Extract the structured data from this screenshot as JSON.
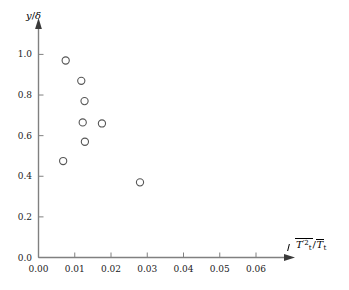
{
  "chart_data": {
    "type": "scatter",
    "title": "",
    "xlabel": "sqrt(T_t'^2)/T_t_bar",
    "ylabel": "y/delta",
    "xlim": [
      0.0,
      0.068
    ],
    "ylim": [
      0.0,
      1.13
    ],
    "xticks": [
      0.0,
      0.01,
      0.02,
      0.03,
      0.04,
      0.05,
      0.06
    ],
    "xtick_labels": [
      "0.00",
      "0.01",
      "0.02",
      "0.03",
      "0.04",
      "0.05",
      "0.06"
    ],
    "yticks": [
      0.0,
      0.2,
      0.4,
      0.6,
      0.8,
      1.0
    ],
    "ytick_labels": [
      "0.0",
      "0.2",
      "0.4",
      "0.6",
      "0.8",
      "1.0"
    ],
    "grid": false,
    "legend": "none",
    "marker": "open-circle",
    "marker_color": "#555555",
    "axis_color": "#808080",
    "series": [
      {
        "name": "total temperature fluctuation profile",
        "x": [
          0.0075,
          0.0118,
          0.0127,
          0.0122,
          0.0175,
          0.0128,
          0.0068,
          0.028
        ],
        "y": [
          0.97,
          0.87,
          0.77,
          0.665,
          0.66,
          0.57,
          0.475,
          0.37
        ]
      }
    ]
  },
  "labels": {
    "y_axis": {
      "var": "y",
      "slash": "/",
      "delta": "δ"
    },
    "x_axis": {
      "numerator_var": "T",
      "numerator_sub": "t",
      "numerator_prime_sup": "′2",
      "divider": "/",
      "denominator_var": "T",
      "denominator_sub": "t"
    }
  }
}
